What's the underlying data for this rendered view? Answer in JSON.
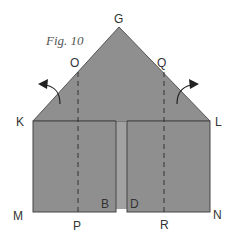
{
  "figure": {
    "caption": "Fig. 10",
    "colors": {
      "paper": "#8f8f8f",
      "paper_under": "#9a9a9a",
      "edge": "#444444",
      "label": "#333333"
    },
    "points": {
      "G": "G",
      "O": "O",
      "Q": "Q",
      "K": "K",
      "L": "L",
      "M": "M",
      "N": "N",
      "P": "P",
      "R": "R",
      "B": "B",
      "D": "D"
    },
    "fold_lines": [
      {
        "from": "O",
        "to": "P",
        "style": "dashed"
      },
      {
        "from": "Q",
        "to": "R",
        "style": "dashed"
      }
    ],
    "arrows": [
      {
        "name": "fold-left-arrow",
        "direction": "up-left"
      },
      {
        "name": "fold-right-arrow",
        "direction": "up-right"
      }
    ]
  }
}
